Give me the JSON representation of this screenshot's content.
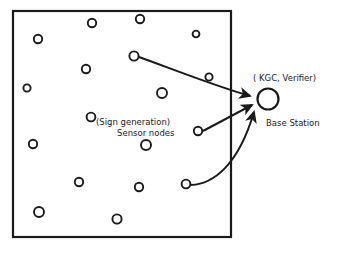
{
  "figure": {
    "frame": {
      "x": 13,
      "y": 11,
      "width": 218,
      "height": 226,
      "stroke": "#1a1a1a",
      "stroke_width": 2.2
    },
    "colors": {
      "ink": "#1a1a1a",
      "background": "#ffffff",
      "caption": "#cfcfcf"
    }
  },
  "labels": {
    "kgc_verifier": "( KGC, Verifier)",
    "base_station": "Base Station",
    "sign_generation": "(Sign generation)",
    "sensor_nodes": "Sensor nodes"
  },
  "caption": {
    "text": ""
  },
  "base_station": {
    "cx": 268,
    "cy": 99,
    "r": 10.5,
    "stroke_width": 2.2
  },
  "sensor_nodes": [
    {
      "id": "n1",
      "cx": 38,
      "cy": 39,
      "r": 4.2
    },
    {
      "id": "n2",
      "cx": 92,
      "cy": 23,
      "r": 4.2
    },
    {
      "id": "n3",
      "cx": 140,
      "cy": 19,
      "r": 4.2
    },
    {
      "id": "n4",
      "cx": 196,
      "cy": 34,
      "r": 3.4
    },
    {
      "id": "n5",
      "cx": 86,
      "cy": 69,
      "r": 4.2
    },
    {
      "id": "n6",
      "cx": 27,
      "cy": 88,
      "r": 3.6
    },
    {
      "id": "n7",
      "cx": 209,
      "cy": 77,
      "r": 3.6
    },
    {
      "id": "n8",
      "cx": 162,
      "cy": 93,
      "r": 5.0
    },
    {
      "id": "n9",
      "cx": 91,
      "cy": 117,
      "r": 4.4
    },
    {
      "id": "n10",
      "cx": 33,
      "cy": 144,
      "r": 4.2
    },
    {
      "id": "n11",
      "cx": 146,
      "cy": 145,
      "r": 5.0
    },
    {
      "id": "n12",
      "cx": 79,
      "cy": 182,
      "r": 4.2
    },
    {
      "id": "n13",
      "cx": 139,
      "cy": 187,
      "r": 4.2
    },
    {
      "id": "n14",
      "cx": 39,
      "cy": 212,
      "r": 5.0
    },
    {
      "id": "n15",
      "cx": 117,
      "cy": 219,
      "r": 4.6
    }
  ],
  "signing_nodes": [
    {
      "id": "s1",
      "cx": 134,
      "cy": 56,
      "r": 4.6
    },
    {
      "id": "s2",
      "cx": 198,
      "cy": 131,
      "r": 4.2
    },
    {
      "id": "s3",
      "cx": 186,
      "cy": 184,
      "r": 4.4
    }
  ],
  "arrows": [
    {
      "id": "arrow-top",
      "from": "s1",
      "to": "base_station",
      "path": "M 139 57 C 175 70 215 86 250 96",
      "style": "curved"
    },
    {
      "id": "arrow-middle",
      "from": "s2",
      "to": "base_station",
      "path": "M 203 131 L 252 105",
      "style": "straight"
    },
    {
      "id": "arrow-bottom",
      "from": "s3",
      "to": "base_station",
      "path": "M 191 185 C 213 184 238 166 254 112",
      "style": "curved"
    }
  ]
}
